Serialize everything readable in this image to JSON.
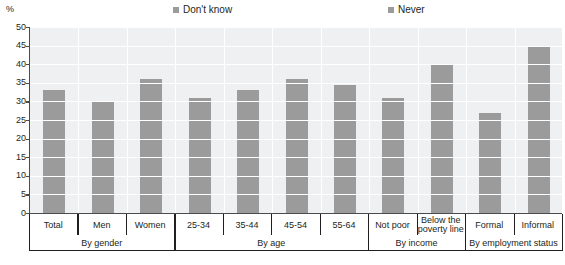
{
  "chart_data": {
    "type": "bar",
    "title": "",
    "subtitle": "",
    "xlabel": "",
    "ylabel": "%",
    "ylim": [
      0,
      50
    ],
    "yticks": [
      50,
      45,
      40,
      35,
      30,
      25,
      20,
      15,
      10,
      5,
      0
    ],
    "grid": true,
    "legend_position": "top",
    "categories": [
      "Total",
      "Men",
      "Women",
      "25-34",
      "35-44",
      "45-54",
      "55-64",
      "Not poor",
      "Below the poverty line",
      "Formal",
      "Informal"
    ],
    "series": [
      {
        "name": "Don't know",
        "color": "#9b9b9b",
        "values": [
          33,
          30,
          36,
          31,
          33,
          36,
          34.5,
          31,
          40,
          27,
          45
        ]
      },
      {
        "name": "Never",
        "color": "#9b9b9b",
        "values": [
          0,
          0,
          0,
          0,
          0,
          0,
          0,
          0,
          0,
          0,
          0
        ]
      }
    ],
    "values": [
      33,
      30,
      36,
      31,
      33,
      36,
      34.5,
      31,
      40,
      27,
      45
    ],
    "groups": [
      {
        "label": "By gender",
        "start": 0,
        "end": 2
      },
      {
        "label": "By age",
        "start": 3,
        "end": 6
      },
      {
        "label": "By income",
        "start": 7,
        "end": 8
      },
      {
        "label": "By employment status",
        "start": 9,
        "end": 10
      }
    ],
    "category_lines": [
      [
        "Total"
      ],
      [
        "Men"
      ],
      [
        "Women"
      ],
      [
        "25-34"
      ],
      [
        "35-44"
      ],
      [
        "45-54"
      ],
      [
        "55-64"
      ],
      [
        "Not poor"
      ],
      [
        "Below the",
        "poverty line"
      ],
      [
        "Formal"
      ],
      [
        "Informal"
      ]
    ]
  },
  "legend": {
    "items": [
      {
        "label": "Don't know",
        "color": "#9b9b9b"
      },
      {
        "label": "Never",
        "color": "#9b9b9b"
      }
    ]
  },
  "axis": {
    "y_unit": "%",
    "y_ticks": [
      "50",
      "45",
      "40",
      "35",
      "30",
      "25",
      "20",
      "15",
      "10",
      "5",
      "0"
    ]
  },
  "colors": {
    "bar": "#9b9b9b",
    "plot_background": "#eef0f1",
    "gridline": "#ffffff",
    "axis": "#4b4b4b",
    "text": "#231f20"
  }
}
